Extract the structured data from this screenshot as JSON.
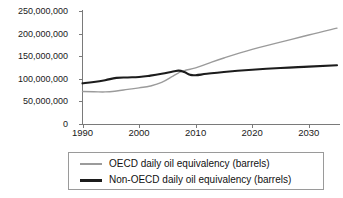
{
  "chart_data": {
    "type": "line",
    "title": "",
    "subtitle": "",
    "xlabel": "",
    "ylabel": "",
    "xlim": [
      1990,
      2035
    ],
    "ylim": [
      0,
      250000000
    ],
    "grid": false,
    "legend_position": "bottom",
    "x_ticks": [
      1990,
      2000,
      2010,
      2020,
      2030
    ],
    "x_tick_labels": [
      "1990",
      "2000",
      "2010",
      "2020",
      "2030"
    ],
    "y_ticks": [
      0,
      50000000,
      100000000,
      150000000,
      200000000,
      250000000
    ],
    "y_tick_labels": [
      "0",
      "50,000,000",
      "100,000,000",
      "150,000,000",
      "200,000,000",
      "250,000,000"
    ],
    "series": [
      {
        "name": "OECD daily oil equivalency (barrels)",
        "color": "#9b9b9b",
        "line_width": 1.4,
        "x": [
          1990,
          1992,
          1994,
          1996,
          1998,
          2000,
          2002,
          2004,
          2006,
          2007,
          2008,
          2010,
          2012,
          2015,
          2020,
          2025,
          2030,
          2035
        ],
        "values": [
          72000000,
          71500000,
          71000000,
          73000000,
          76500000,
          80000000,
          84000000,
          92000000,
          106000000,
          113000000,
          118000000,
          124000000,
          133000000,
          146000000,
          165000000,
          181000000,
          197000000,
          212000000
        ]
      },
      {
        "name": "Non-OECD daily oil equivalency (barrels)",
        "color": "#1c1c1c",
        "line_width": 2.1,
        "x": [
          1990,
          1992,
          1994,
          1996,
          1998,
          2000,
          2002,
          2004,
          2006,
          2007,
          2008,
          2009,
          2010,
          2012,
          2015,
          2020,
          2025,
          2030,
          2035
        ],
        "values": [
          90000000,
          93000000,
          97000000,
          102000000,
          103000000,
          104000000,
          107000000,
          111000000,
          116000000,
          118000000,
          115000000,
          109000000,
          108000000,
          111000000,
          115000000,
          120000000,
          124000000,
          127000000,
          130000000
        ]
      }
    ],
    "crossover": {
      "approx_year": 2008,
      "approx_value": 117000000
    }
  },
  "legend": {
    "entries": [
      {
        "label": "OECD daily oil equivalency (barrels)",
        "swatch": "oecd-line-swatch"
      },
      {
        "label": "Non-OECD daily oil equivalency (barrels)",
        "swatch": "non-oecd-line-swatch"
      }
    ]
  },
  "colors": {
    "oecd": "#9b9b9b",
    "non_oecd": "#1c1c1c",
    "axis": "#7a7a7a",
    "legend_border": "#9a9a9a",
    "background": "#ffffff",
    "text": "#1a1a1a"
  }
}
